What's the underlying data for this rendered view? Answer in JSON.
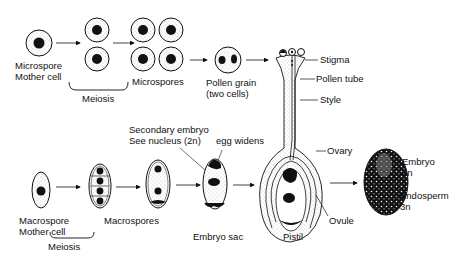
{
  "colors": {
    "ink": "#111111",
    "stipple": "#8a8a8a",
    "background": "#ffffff"
  },
  "top_row": {
    "microspore_mother_cell": {
      "line1": "Microspore",
      "line2": "Mother cell"
    },
    "meiosis": "Meiosis",
    "microspores": "Microspores",
    "pollen_grain": {
      "line1": "Pollen grain",
      "line2": "(two cells)"
    }
  },
  "pistil_parts": {
    "stigma": "Stigma",
    "pollen_tube": "Pollen tube",
    "style": "Style",
    "ovary": "Ovary",
    "ovule": "Ovule",
    "pistil": "Pistil"
  },
  "bottom_row": {
    "macrospore_mother_cell": {
      "line1": "Macrospore",
      "line2": "Mother cell"
    },
    "meiosis": "Meiosis",
    "macrospores": "Macrospores",
    "secondary_nucleus": {
      "line1": "Secondary embryo",
      "line2": "See nucleus (2n)"
    },
    "egg_widens": "egg widens",
    "embryo_sac": "Embryo sac"
  },
  "seed": {
    "embryo": {
      "line1": "Embryo",
      "line2": "2n"
    },
    "endosperm": {
      "line1": "Endosperm",
      "line2": "3n"
    }
  }
}
